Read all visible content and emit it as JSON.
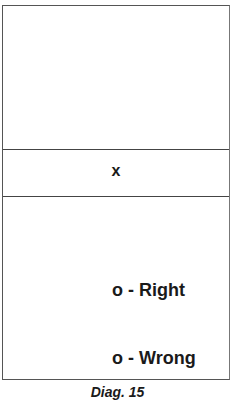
{
  "diagram": {
    "center_mark": "x",
    "options": [
      {
        "symbol": "o",
        "label": "o - Right"
      },
      {
        "symbol": "o",
        "label": "o - Wrong"
      }
    ],
    "caption": "Diag. 15"
  }
}
